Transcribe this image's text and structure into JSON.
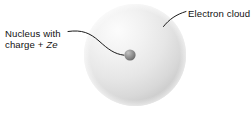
{
  "figure": {
    "background_color": "#ffffff",
    "text_color": "#111111"
  },
  "labels": {
    "nucleus": {
      "line1": "Nucleus with",
      "line2_prefix": "charge + ",
      "line2_symbol": "Ze",
      "full_text": "Nucleus with charge + Ze"
    },
    "electron_cloud": {
      "text": "Electron cloud"
    }
  },
  "shapes": {
    "electron_cloud": {
      "name": "electron-cloud-sphere",
      "center_x": 135,
      "center_y": 55,
      "radius": 51,
      "highlight_color": "#fbfbfb",
      "mid_color": "#e2e2e2",
      "edge_color": "#c6c6c6"
    },
    "nucleus": {
      "name": "nucleus-sphere",
      "center_x": 130,
      "center_y": 55,
      "radius": 5.5,
      "highlight_color": "#b9b9b9",
      "mid_color": "#8d8d8d",
      "edge_color": "#6a6a6a"
    }
  },
  "leader_lines": {
    "nucleus_leader": {
      "name": "nucleus-leader-line",
      "path": "M 68 31.5 C 82 29.5, 90 33, 99 41 C 108 49, 114 54, 124 55.2",
      "color": "#1a1a1a",
      "width": 1.0
    },
    "electron_cloud_leader": {
      "name": "electron-cloud-leader-line",
      "path": "M 186 11.5 C 176 14.5, 169 19.5, 163.5 26.5",
      "color": "#1a1a1a",
      "width": 1.0
    }
  }
}
